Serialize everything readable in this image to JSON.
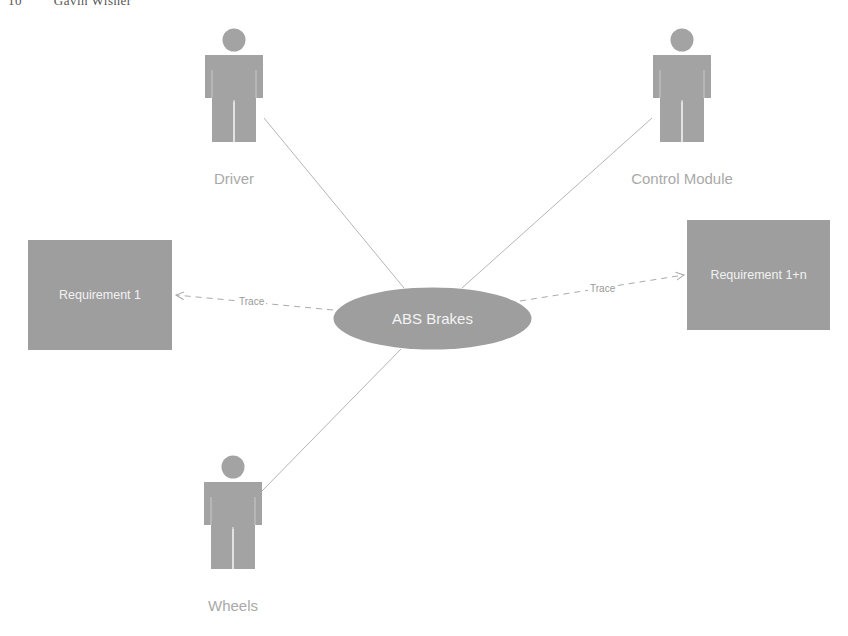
{
  "header": {
    "page_number": "10",
    "author": "Gavin Wisner"
  },
  "colors": {
    "shape_fill": "#9e9e9e",
    "actor_fill": "#a3a3a3",
    "label_text": "#a9a9a9",
    "line": "#b5b5b5"
  },
  "actors": [
    {
      "id": "driver",
      "label": "Driver",
      "icon": "person-icon"
    },
    {
      "id": "control-module",
      "label": "Control Module",
      "icon": "person-icon"
    },
    {
      "id": "wheels",
      "label": "Wheels",
      "icon": "person-icon"
    }
  ],
  "use_case": {
    "label": "ABS Brakes"
  },
  "requirements": [
    {
      "id": "req-1",
      "label": "Requirement 1"
    },
    {
      "id": "req-1n",
      "label": "Requirement 1+n"
    }
  ],
  "relations": [
    {
      "from": "ABS Brakes",
      "to": "Requirement 1",
      "type": "dashed-arrow",
      "label": "Trace"
    },
    {
      "from": "ABS Brakes",
      "to": "Requirement 1+n",
      "type": "dashed-arrow",
      "label": "Trace"
    },
    {
      "from": "Driver",
      "to": "ABS Brakes",
      "type": "association"
    },
    {
      "from": "Control Module",
      "to": "ABS Brakes",
      "type": "association"
    },
    {
      "from": "Wheels",
      "to": "ABS Brakes",
      "type": "association"
    }
  ]
}
